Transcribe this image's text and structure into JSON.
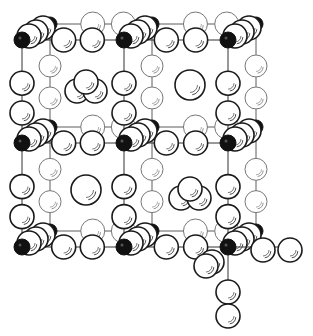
{
  "diagram": {
    "type": "crystal-structure",
    "colors": {
      "background": "#ffffff",
      "line": "#333333",
      "dark_atom": "#111111",
      "light_atom_fill": "#ffffff",
      "front_outline": "#1a1a1a",
      "back_outline": "#777777"
    },
    "front_grid": {
      "xs": [
        22,
        124,
        228
      ],
      "ys": [
        40,
        143,
        247
      ]
    },
    "back_grid": {
      "xs": [
        50,
        152,
        256
      ],
      "ys": [
        24,
        127,
        231
      ]
    },
    "dark_atoms": [
      {
        "x": 22,
        "y": 40
      },
      {
        "x": 124,
        "y": 40
      },
      {
        "x": 228,
        "y": 40
      },
      {
        "x": 22,
        "y": 143
      },
      {
        "x": 124,
        "y": 143
      },
      {
        "x": 228,
        "y": 143
      },
      {
        "x": 22,
        "y": 247
      },
      {
        "x": 124,
        "y": 247
      },
      {
        "x": 228,
        "y": 247
      },
      {
        "x": 50,
        "y": 24
      },
      {
        "x": 152,
        "y": 24
      },
      {
        "x": 256,
        "y": 24
      },
      {
        "x": 50,
        "y": 127
      },
      {
        "x": 152,
        "y": 127
      },
      {
        "x": 256,
        "y": 127
      },
      {
        "x": 50,
        "y": 231
      },
      {
        "x": 152,
        "y": 231
      },
      {
        "x": 256,
        "y": 231
      }
    ],
    "cells": [
      {
        "id": "top-left",
        "center": "trimer",
        "cx": 86,
        "cy": 88
      },
      {
        "id": "top-right",
        "center": "sphere",
        "cx": 190,
        "cy": 85
      },
      {
        "id": "bottom-left",
        "center": "sphere",
        "cx": 86,
        "cy": 190
      },
      {
        "id": "bottom-right",
        "center": "trimer",
        "cx": 190,
        "cy": 195
      }
    ],
    "extension": {
      "direction": [
        "right",
        "down"
      ],
      "note": "chain extends to the right and downward from bottom-right corner"
    }
  }
}
